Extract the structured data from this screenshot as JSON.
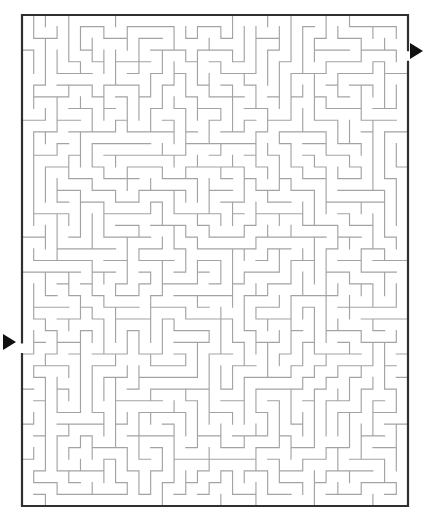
{
  "page": {
    "background_color": "#ffffff",
    "width": 447,
    "height": 526
  },
  "maze": {
    "type": "rectangular-perfect-maze",
    "origin_x": 22,
    "origin_y": 15,
    "width_px": 386,
    "height_px": 491,
    "cols": 33,
    "rows": 42,
    "cell_size": 11.7,
    "border_color": "#2f2f2f",
    "border_width": 2.2,
    "wall_color": "#a3a3a3",
    "wall_width": 1.15,
    "seed": 20240517
  },
  "markers": {
    "entrance": {
      "name": "entrance-arrow",
      "label": "Start",
      "side": "left",
      "direction": "right",
      "tip_x": 22,
      "center_y": 342,
      "size": 13,
      "color": "#111111",
      "gap_row": 28
    },
    "exit": {
      "name": "exit-arrow",
      "label": "Finish",
      "side": "right",
      "direction": "right",
      "base_x": 423,
      "center_y": 51,
      "size": 13,
      "color": "#111111",
      "gap_row": 3
    }
  }
}
